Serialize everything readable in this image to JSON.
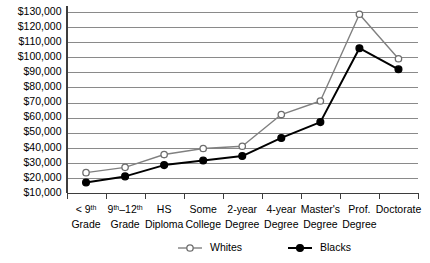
{
  "chart_data": {
    "type": "line",
    "title": "",
    "subtitle": "",
    "xlabel": "",
    "ylabel": "",
    "ylim": [
      10000,
      130000
    ],
    "ytick_step": 10000,
    "grid": true,
    "legend_position": "bottom",
    "categories": [
      "< 9th Grade",
      "9th–12th Grade",
      "HS Diploma",
      "Some College",
      "2-year Degree",
      "4-year Degree",
      "Master's Degree",
      "Prof. Degree",
      "Doctorate"
    ],
    "category_lines": [
      [
        "< 9",
        "th",
        " ",
        "Grade"
      ],
      [
        "9",
        "th",
        "–12",
        "th",
        "Grade"
      ],
      [
        "HS",
        "",
        "",
        "Diploma"
      ],
      [
        "Some",
        "",
        "",
        "College"
      ],
      [
        "2-year",
        "",
        "",
        "Degree"
      ],
      [
        "4-year",
        "",
        "",
        "Degree"
      ],
      [
        "Master's",
        "",
        "",
        "Degree"
      ],
      [
        "Prof.",
        "",
        "",
        "Degree"
      ],
      [
        "Doctorate",
        "",
        "",
        ""
      ]
    ],
    "ytick_labels": [
      "$130,000",
      "$120,000",
      "$110,000",
      "$100,000",
      "$90,000",
      "$80,000",
      "$70,000",
      "$60,000",
      "$50,000",
      "$40,000",
      "$30,000",
      "$20,000",
      "$10,000"
    ],
    "ytick_values": [
      130000,
      120000,
      110000,
      100000,
      90000,
      80000,
      70000,
      60000,
      50000,
      40000,
      30000,
      20000,
      10000
    ],
    "series": [
      {
        "name": "Whites",
        "marker": "open-circle",
        "color": "#808080",
        "values": [
          23500,
          27000,
          35500,
          39500,
          41000,
          62000,
          71000,
          128500,
          99000
        ]
      },
      {
        "name": "Blacks",
        "marker": "filled-circle",
        "color": "#000000",
        "values": [
          17000,
          21000,
          28500,
          31500,
          34500,
          46500,
          57000,
          106000,
          92000
        ]
      }
    ]
  },
  "legend": {
    "items": [
      {
        "label": "Whites",
        "marker": "open-circle"
      },
      {
        "label": "Blacks",
        "marker": "filled-circle"
      }
    ]
  },
  "colors": {
    "whites_line": "#808080",
    "blacks_line": "#000000",
    "gridline": "#8a8a8a",
    "axis": "#3d3d3d",
    "background": "#ffffff",
    "text": "#000000"
  }
}
